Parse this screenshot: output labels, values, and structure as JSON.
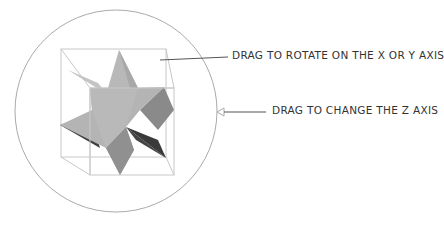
{
  "labels": {
    "rotate_xy": "DRAG TO ROTATE ON THE X OR Y AXIS",
    "rotate_z": "DRAG TO CHANGE THE Z AXIS"
  },
  "colors": {
    "circle": "#aaaaaa",
    "cube_edges": "#c0c0c0",
    "leader": "#555555",
    "star_light": "#b5b5b5",
    "star_mid": "#8f8f8f",
    "star_dark": "#3d3d3d"
  },
  "widget": {
    "trackball": "rotation trackball",
    "object": "six-pointed star polyhedron in bounding cube"
  }
}
